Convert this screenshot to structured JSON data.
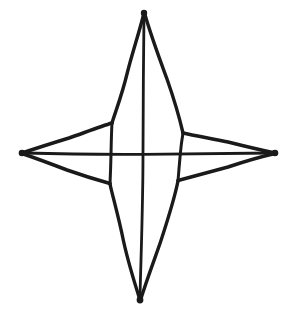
{
  "document": {
    "title": "Four-Pointed Star Line Drawing",
    "background_color": "#ffffff",
    "ink_color": "#1a1a1a",
    "canvas": {
      "width": 297,
      "height": 315
    },
    "description": "Hand-drawn black ink outline of a slender four-pointed star (compass rose / sparkle) on a plain white background, with internal construction lines forming a cross through the centre."
  },
  "chart_data": {
    "type": "line",
    "subtitle": "",
    "xlabel": "",
    "ylabel": "",
    "xlim": [
      0,
      297
    ],
    "ylim": [
      0,
      315
    ],
    "grid": false,
    "legend": "none",
    "stroke_color": "#1a1a1a",
    "stroke_width": 3,
    "background": "#ffffff",
    "annotations": [],
    "vertices": {
      "top_apex": [
        144,
        13
      ],
      "bottom_apex": [
        140,
        300
      ],
      "left_apex": [
        22,
        153
      ],
      "right_apex": [
        275,
        153
      ],
      "center": [
        143,
        154
      ],
      "shoulder_upper_left": [
        112,
        123
      ],
      "shoulder_upper_right": [
        183,
        133
      ],
      "shoulder_lower_left": [
        110,
        183
      ],
      "shoulder_lower_right": [
        178,
        180
      ]
    },
    "series": [
      {
        "name": "top-point-left-edge",
        "points": [
          [
            144,
            13
          ],
          [
            128,
            70
          ],
          [
            112,
            123
          ]
        ]
      },
      {
        "name": "top-point-right-edge",
        "points": [
          [
            144,
            13
          ],
          [
            167,
            78
          ],
          [
            183,
            133
          ]
        ]
      },
      {
        "name": "left-point-upper-edge",
        "points": [
          [
            22,
            153
          ],
          [
            68,
            138
          ],
          [
            112,
            123
          ]
        ]
      },
      {
        "name": "left-point-lower-edge",
        "points": [
          [
            22,
            153
          ],
          [
            66,
            169
          ],
          [
            110,
            183
          ]
        ]
      },
      {
        "name": "right-point-upper-edge",
        "points": [
          [
            275,
            153
          ],
          [
            230,
            142
          ],
          [
            183,
            133
          ]
        ]
      },
      {
        "name": "right-point-lower-edge",
        "points": [
          [
            275,
            153
          ],
          [
            228,
            167
          ],
          [
            178,
            180
          ]
        ]
      },
      {
        "name": "bottom-point-left-edge",
        "points": [
          [
            140,
            300
          ],
          [
            124,
            243
          ],
          [
            110,
            183
          ]
        ]
      },
      {
        "name": "bottom-point-right-edge",
        "points": [
          [
            140,
            300
          ],
          [
            161,
            242
          ],
          [
            178,
            180
          ]
        ]
      },
      {
        "name": "inner-vertical-construction-line",
        "points": [
          [
            144,
            14
          ],
          [
            143,
            100
          ],
          [
            143,
            200
          ],
          [
            140,
            299
          ]
        ]
      },
      {
        "name": "inner-horizontal-construction-line",
        "points": [
          [
            23,
            153
          ],
          [
            80,
            154
          ],
          [
            143,
            154
          ],
          [
            210,
            153
          ],
          [
            274,
            153
          ]
        ]
      },
      {
        "name": "shoulder-link-upper-left",
        "points": [
          [
            112,
            123
          ],
          [
            111,
            154
          ]
        ]
      },
      {
        "name": "shoulder-link-lower-left",
        "points": [
          [
            111,
            154
          ],
          [
            110,
            183
          ]
        ]
      },
      {
        "name": "shoulder-link-upper-right",
        "points": [
          [
            183,
            133
          ],
          [
            180,
            154
          ]
        ]
      },
      {
        "name": "shoulder-link-lower-right",
        "points": [
          [
            180,
            154
          ],
          [
            178,
            180
          ]
        ]
      }
    ]
  }
}
